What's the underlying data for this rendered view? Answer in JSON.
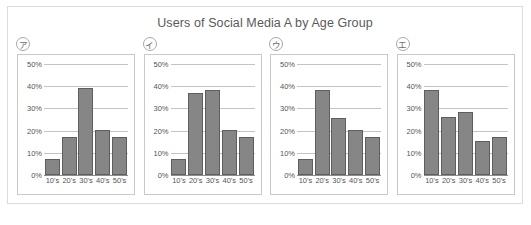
{
  "title": "Users of Social Media A by Age Group",
  "axis": {
    "y_ticks": [
      "0%",
      "10%",
      "20%",
      "30%",
      "40%",
      "50%"
    ],
    "x_ticks": [
      "10's",
      "20's",
      "30's",
      "40's",
      "50's"
    ]
  },
  "colors": {
    "bar_fill": "#868686",
    "bar_border": "#5e5e5e",
    "gridline": "#c4c4c4",
    "panel_border": "#c9c9c9",
    "frame_border": "#dcdcdc",
    "text": "#555555",
    "title_text": "#595959"
  },
  "panels": [
    {
      "tag": "ア",
      "values": [
        7,
        17,
        39,
        20.5,
        17
      ]
    },
    {
      "tag": "イ",
      "values": [
        7,
        37,
        38.5,
        20.5,
        17
      ]
    },
    {
      "tag": "ウ",
      "values": [
        7,
        38.5,
        25.5,
        20.5,
        17
      ]
    },
    {
      "tag": "エ",
      "values": [
        38.5,
        26,
        28.5,
        15.5,
        17
      ]
    }
  ],
  "chart_data": {
    "type": "bar",
    "title": "Users of Social Media A by Age Group",
    "xlabel": "",
    "ylabel": "",
    "categories": [
      "10's",
      "20's",
      "30's",
      "40's",
      "50's"
    ],
    "ylim": [
      0,
      50
    ],
    "ytick_labels": [
      "0%",
      "10%",
      "20%",
      "30%",
      "40%",
      "50%"
    ],
    "grid": true,
    "legend": "none",
    "panel_layout": "1x4",
    "series": [
      {
        "name": "ア",
        "values": [
          7,
          17,
          39,
          20.5,
          17
        ]
      },
      {
        "name": "イ",
        "values": [
          7,
          37,
          38.5,
          20.5,
          17
        ]
      },
      {
        "name": "ウ",
        "values": [
          7,
          38.5,
          25.5,
          20.5,
          17
        ]
      },
      {
        "name": "エ",
        "values": [
          38.5,
          26,
          28.5,
          15.5,
          17
        ]
      }
    ]
  }
}
